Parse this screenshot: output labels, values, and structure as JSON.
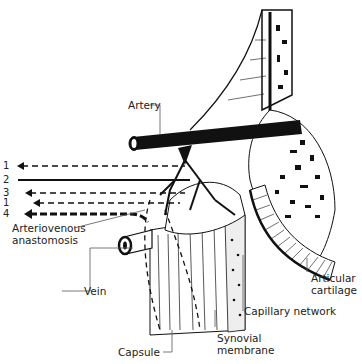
{
  "diagram": {
    "labels": {
      "artery": "Artery",
      "arteriovenous_anastomosis_line1": "Arteriovenous",
      "arteriovenous_anastomosis_line2": "anastomosis",
      "vein": "Vein",
      "capsule": "Capsule",
      "synovial_membrane_line1": "Synovial",
      "synovial_membrane_line2": "membrane",
      "capillary_network": "Capillary network",
      "articular_cartilage_line1": "Articular",
      "articular_cartilage_line2": "cartilage"
    },
    "flow_arrows": [
      {
        "number": "1",
        "style": "dashed"
      },
      {
        "number": "2",
        "style": "solid"
      },
      {
        "number": "3",
        "style": "dashed"
      },
      {
        "number": "1",
        "style": "dashed"
      },
      {
        "number": "4",
        "style": "heavy-dashed"
      }
    ]
  }
}
